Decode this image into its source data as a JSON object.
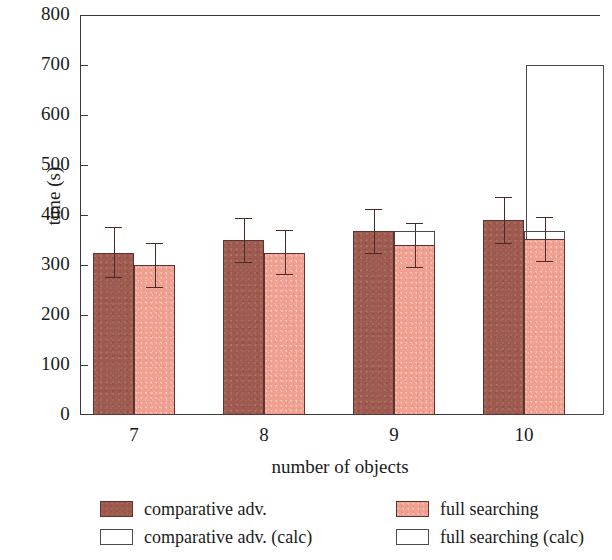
{
  "chart_data": {
    "type": "bar",
    "title": "",
    "xlabel": "number of objects",
    "ylabel": "time (s)",
    "categories": [
      "7",
      "8",
      "9",
      "10"
    ],
    "xtick_labels": [
      "7",
      "8",
      "9",
      "10"
    ],
    "ytick_labels": [
      "0",
      "100",
      "200",
      "300",
      "400",
      "500",
      "600",
      "700",
      "800"
    ],
    "ytick_values": [
      0,
      100,
      200,
      300,
      400,
      500,
      600,
      700,
      800
    ],
    "ylim": [
      0,
      800
    ],
    "grid": false,
    "legend_position": "below-axes",
    "series": [
      {
        "name": "comparative adv.",
        "key": "comparative_adv",
        "style": "dark",
        "color": "#9e5a4e",
        "edge_color": "#5d3430",
        "values": [
          325,
          350,
          368,
          390
        ],
        "err_upper": [
          52,
          45,
          45,
          47
        ],
        "err_lower": [
          50,
          45,
          45,
          47
        ]
      },
      {
        "name": "full searching",
        "key": "full_searching",
        "style": "light",
        "color": "#f0a091",
        "edge_color": "#5d3430",
        "values": [
          300,
          325,
          340,
          352
        ],
        "err_upper": [
          45,
          45,
          45,
          45
        ],
        "err_lower": [
          45,
          45,
          45,
          45
        ]
      },
      {
        "name": "comparative adv. (calc)",
        "key": "comparative_adv_calc",
        "style": "open",
        "color": "#ffffff",
        "edge_color": "#4a4a4a",
        "values": [
          0,
          0,
          0,
          700
        ]
      },
      {
        "name": "full searching (calc)",
        "key": "full_searching_calc",
        "style": "open",
        "color": "#ffffff",
        "edge_color": "#4a4a4a",
        "values": [
          0,
          0,
          368,
          368
        ]
      }
    ]
  },
  "axes": {
    "ylabel": "time (s)",
    "xlabel": "number of objects",
    "yticks": [
      {
        "value": 800,
        "label": "800"
      },
      {
        "value": 700,
        "label": "700"
      },
      {
        "value": 600,
        "label": "600"
      },
      {
        "value": 500,
        "label": "500"
      },
      {
        "value": 400,
        "label": "400"
      },
      {
        "value": 300,
        "label": "300"
      },
      {
        "value": 200,
        "label": "200"
      },
      {
        "value": 100,
        "label": "100"
      },
      {
        "value": 0,
        "label": "0"
      }
    ],
    "xticks": [
      {
        "label": "7"
      },
      {
        "label": "8"
      },
      {
        "label": "9"
      },
      {
        "label": "10"
      }
    ]
  },
  "legend": {
    "entries": [
      {
        "label": "comparative adv.",
        "style": "dark",
        "col": 0,
        "row": 0
      },
      {
        "label": "full searching",
        "style": "light",
        "col": 1,
        "row": 0
      },
      {
        "label": "comparative adv. (calc)",
        "style": "open",
        "col": 0,
        "row": 1
      },
      {
        "label": "full searching (calc)",
        "style": "open",
        "col": 1,
        "row": 1
      }
    ]
  },
  "colors": {
    "dark_bar": "#9e5a4e",
    "light_bar": "#f0a091",
    "open_bar": "#ffffff",
    "bar_edge": "#5d3430",
    "axis": "#3a3a3a",
    "error_bar": "#4a2a26",
    "background": "#ffffff"
  }
}
